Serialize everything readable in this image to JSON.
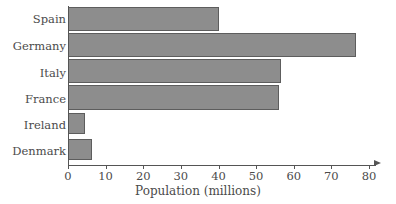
{
  "chart_data": {
    "type": "bar",
    "orientation": "horizontal",
    "title": "",
    "xlabel": "Population (millions)",
    "ylabel": "",
    "categories": [
      "Spain",
      "Germany",
      "Italy",
      "France",
      "Ireland",
      "Denmark"
    ],
    "values": [
      40,
      76.5,
      56.5,
      56,
      4.5,
      6.5
    ],
    "xlim": [
      0,
      80
    ],
    "xticks": [
      0,
      10,
      20,
      30,
      40,
      50,
      60,
      70,
      80
    ],
    "xtick_labels": [
      "0",
      "10",
      "20",
      "30",
      "40",
      "50",
      "60",
      "70",
      "80"
    ],
    "grid": false,
    "legend": null,
    "bar_color": "#8d8d8d",
    "bar_edge_color": "#5d5d5d",
    "axis_color": "#555555",
    "text_color": "#4b4b4b",
    "background_color": "#ffffff",
    "axis_arrow": true
  }
}
